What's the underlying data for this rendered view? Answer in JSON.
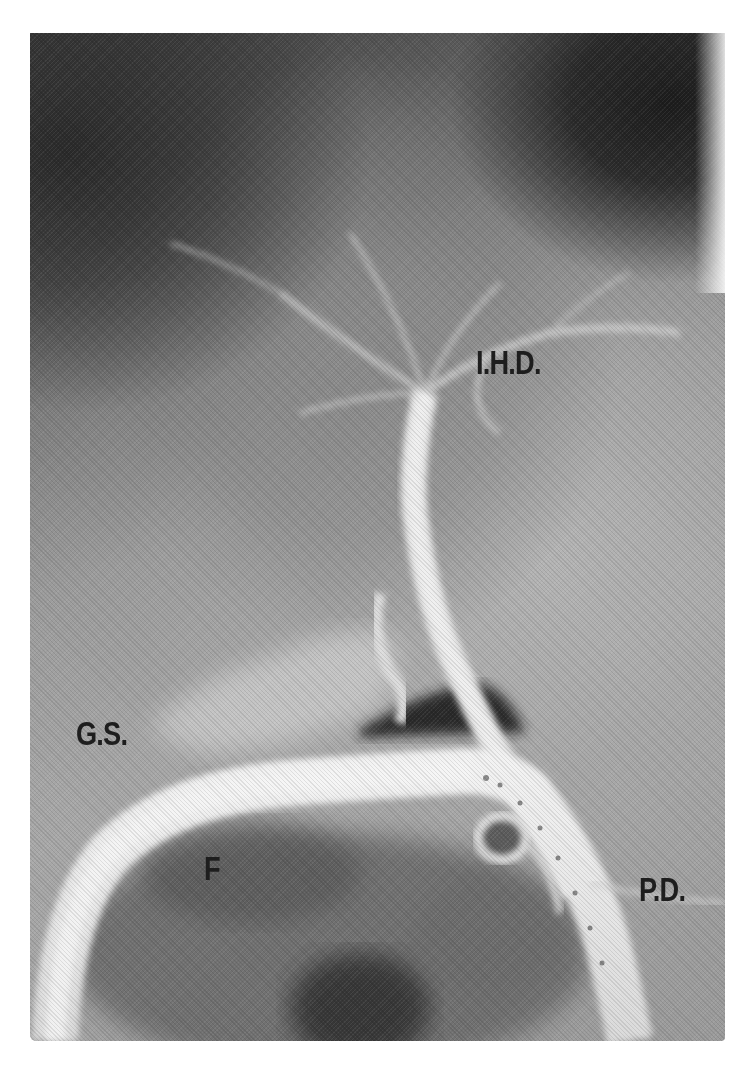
{
  "figure": {
    "type": "cholangiogram radiograph",
    "colors": {
      "background": "#ffffff",
      "film_dark": "#1c1c1c",
      "film_mid": "#9c9c9c",
      "contrast_bright": "#e8e8e8",
      "label_ink": "#1e1e1e"
    },
    "labels": {
      "ihd": "I.H.D.",
      "gs": "G.S.",
      "f": "F",
      "pd": "P.D."
    }
  }
}
